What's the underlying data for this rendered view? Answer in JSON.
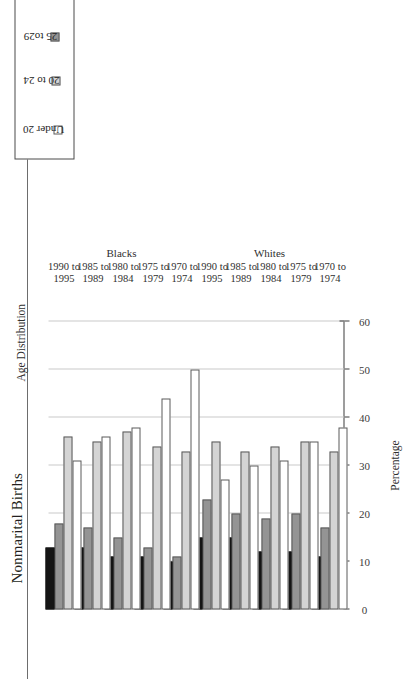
{
  "figure": {
    "title": "Nonmarital Births",
    "caption": "Age Distribution"
  },
  "legend": {
    "items": [
      {
        "label": "Under 20",
        "color": "#ffffff"
      },
      {
        "label": "20 to 24",
        "color": "#d4d4d4"
      },
      {
        "label": "25 to29",
        "color": "#949494"
      },
      {
        "label": "30 or older",
        "color": "#151515"
      }
    ]
  },
  "chart_data": {
    "type": "bar",
    "title": "Nonmarital Births",
    "subtitle": "Age Distribution",
    "orientation": "horizontal",
    "grid": true,
    "legend_position": "top-left",
    "xlabel": "",
    "ylabel": "Percentage",
    "axis_title": "Percentage",
    "ylim": [
      0,
      60
    ],
    "ticks": [
      0,
      10,
      20,
      30,
      40,
      50,
      60
    ],
    "tick_labels": [
      "0",
      "10",
      "20",
      "30",
      "40",
      "50",
      "60"
    ],
    "groups": [
      "Whites",
      "Blacks"
    ],
    "categories": [
      {
        "line1": "1970 to",
        "line2": "1974"
      },
      {
        "line1": "1975 to",
        "line2": "1979"
      },
      {
        "line1": "1980 to",
        "line2": "1984"
      },
      {
        "line1": "1985 to",
        "line2": "1989"
      },
      {
        "line1": "1990 to",
        "line2": "1995"
      }
    ],
    "series": [
      {
        "name": "Under 20",
        "color": "#ffffff",
        "Whites": [
          38,
          35,
          31,
          30,
          27
        ],
        "Blacks": [
          50,
          44,
          38,
          36,
          31
        ]
      },
      {
        "name": "20 to 24",
        "color": "#d4d4d4",
        "Whites": [
          33,
          35,
          34,
          33,
          35
        ],
        "Blacks": [
          33,
          34,
          37,
          35,
          36
        ]
      },
      {
        "name": "25 to29",
        "color": "#949494",
        "Whites": [
          17,
          20,
          19,
          20,
          23
        ],
        "Blacks": [
          11,
          13,
          15,
          17,
          18
        ]
      },
      {
        "name": "30 or older",
        "color": "#151515",
        "Whites": [
          11,
          12,
          12,
          15,
          15
        ],
        "Blacks": [
          10,
          11,
          11,
          13,
          13
        ]
      }
    ]
  }
}
